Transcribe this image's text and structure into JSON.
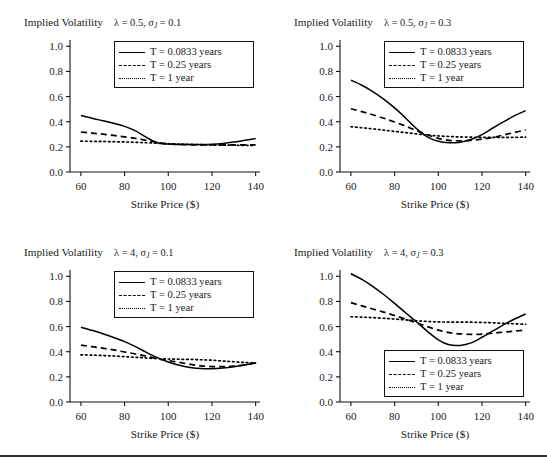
{
  "figure": {
    "ghost_caption_fragment": "",
    "bottom_rule": true
  },
  "axis": {
    "y_title": "Implied Volatility",
    "x_title": "Strike Price ($)",
    "y_ticks": [
      "0.0",
      "0.2",
      "0.4",
      "0.6",
      "0.8",
      "1.0"
    ],
    "y_tick_values": [
      0.0,
      0.2,
      0.4,
      0.6,
      0.8,
      1.0
    ],
    "x_ticks": [
      "60",
      "80",
      "100",
      "120",
      "140"
    ],
    "x_tick_values": [
      60,
      80,
      100,
      120,
      140
    ],
    "xlim": [
      55,
      142
    ],
    "ylim": [
      0.0,
      1.05
    ]
  },
  "legend": {
    "entries": [
      {
        "style": "solid",
        "label": "T = 0.0833 years"
      },
      {
        "style": "dashed",
        "label": "T = 0.25 years"
      },
      {
        "style": "dotted",
        "label": "T = 1 year"
      }
    ]
  },
  "panels": [
    {
      "id": "panel-lambda05-sigma01",
      "params_html": "&#955; = 0.5, &#963;<sub>J</sub> = 0.1",
      "params_text": "λ = 0.5, σ_J = 0.1",
      "lambda": 0.5,
      "sigma_j": 0.1,
      "legend_position": "top-right"
    },
    {
      "id": "panel-lambda05-sigma03",
      "params_html": "&#955; = 0.5, &#963;<sub>J</sub> = 0.3",
      "params_text": "λ = 0.5, σ_J = 0.3",
      "lambda": 0.5,
      "sigma_j": 0.3,
      "legend_position": "top-right"
    },
    {
      "id": "panel-lambda4-sigma01",
      "params_html": "&#955; = 4, &#963;<sub>J</sub> = 0.1",
      "params_text": "λ = 4, σ_J = 0.1",
      "lambda": 4,
      "sigma_j": 0.1,
      "legend_position": "top-right"
    },
    {
      "id": "panel-lambda4-sigma03",
      "params_html": "&#955; = 4, &#963;<sub>J</sub> = 0.3",
      "params_text": "λ = 4, σ_J = 0.3",
      "lambda": 4,
      "sigma_j": 0.3,
      "legend_position": "bottom-right"
    }
  ],
  "chart_data": [
    {
      "type": "line",
      "title": "λ = 0.5, σ_J = 0.1",
      "xlabel": "Strike Price ($)",
      "ylabel": "Implied Volatility",
      "xlim": [
        55,
        142
      ],
      "ylim": [
        0.0,
        1.05
      ],
      "grid": false,
      "legend_position": "upper right",
      "x": [
        60,
        65,
        70,
        75,
        80,
        85,
        90,
        95,
        100,
        105,
        110,
        115,
        120,
        125,
        130,
        135,
        140
      ],
      "series": [
        {
          "name": "T = 0.0833 years",
          "style": "solid",
          "values": [
            0.45,
            0.428,
            0.408,
            0.388,
            0.363,
            0.327,
            0.275,
            0.233,
            0.222,
            0.219,
            0.218,
            0.218,
            0.22,
            0.227,
            0.238,
            0.252,
            0.266
          ]
        },
        {
          "name": "T = 0.25 years",
          "style": "dashed",
          "values": [
            0.318,
            0.31,
            0.301,
            0.291,
            0.28,
            0.267,
            0.252,
            0.235,
            0.224,
            0.219,
            0.217,
            0.216,
            0.216,
            0.216,
            0.216,
            0.216,
            0.216
          ]
        },
        {
          "name": "T = 1 year",
          "style": "dotted",
          "values": [
            0.245,
            0.244,
            0.243,
            0.241,
            0.239,
            0.236,
            0.233,
            0.229,
            0.225,
            0.222,
            0.219,
            0.217,
            0.215,
            0.214,
            0.213,
            0.212,
            0.212
          ]
        }
      ]
    },
    {
      "type": "line",
      "title": "λ = 0.5, σ_J = 0.3",
      "xlabel": "Strike Price ($)",
      "ylabel": "Implied Volatility",
      "xlim": [
        55,
        142
      ],
      "ylim": [
        0.0,
        1.05
      ],
      "grid": false,
      "legend_position": "upper right",
      "x": [
        60,
        65,
        70,
        75,
        80,
        85,
        90,
        95,
        100,
        105,
        110,
        115,
        120,
        125,
        130,
        135,
        140
      ],
      "series": [
        {
          "name": "T = 0.0833 years",
          "style": "solid",
          "values": [
            0.73,
            0.69,
            0.64,
            0.58,
            0.51,
            0.43,
            0.345,
            0.28,
            0.244,
            0.233,
            0.237,
            0.258,
            0.298,
            0.35,
            0.4,
            0.448,
            0.488
          ]
        },
        {
          "name": "T = 0.25 years",
          "style": "dashed",
          "values": [
            0.503,
            0.48,
            0.455,
            0.428,
            0.398,
            0.365,
            0.33,
            0.296,
            0.268,
            0.252,
            0.248,
            0.252,
            0.262,
            0.275,
            0.295,
            0.315,
            0.335
          ]
        },
        {
          "name": "T = 1 year",
          "style": "dotted",
          "values": [
            0.36,
            0.352,
            0.343,
            0.333,
            0.323,
            0.313,
            0.303,
            0.294,
            0.287,
            0.282,
            0.279,
            0.277,
            0.276,
            0.275,
            0.275,
            0.276,
            0.277
          ]
        }
      ]
    },
    {
      "type": "line",
      "title": "λ = 4, σ_J = 0.1",
      "xlabel": "Strike Price ($)",
      "ylabel": "Implied Volatility",
      "xlim": [
        55,
        142
      ],
      "ylim": [
        0.0,
        1.05
      ],
      "grid": false,
      "legend_position": "upper right",
      "x": [
        60,
        65,
        70,
        75,
        80,
        85,
        90,
        95,
        100,
        105,
        110,
        115,
        120,
        125,
        130,
        135,
        140
      ],
      "series": [
        {
          "name": "T = 0.0833 years",
          "style": "solid",
          "values": [
            0.595,
            0.57,
            0.543,
            0.513,
            0.48,
            0.44,
            0.395,
            0.353,
            0.318,
            0.292,
            0.275,
            0.266,
            0.265,
            0.27,
            0.28,
            0.295,
            0.31
          ]
        },
        {
          "name": "T = 0.25 years",
          "style": "dashed",
          "values": [
            0.452,
            0.44,
            0.428,
            0.414,
            0.398,
            0.382,
            0.364,
            0.345,
            0.33,
            0.315,
            0.3,
            0.288,
            0.282,
            0.281,
            0.285,
            0.295,
            0.312
          ]
        },
        {
          "name": "T = 1 year",
          "style": "dotted",
          "values": [
            0.375,
            0.373,
            0.37,
            0.366,
            0.361,
            0.356,
            0.35,
            0.345,
            0.342,
            0.34,
            0.339,
            0.336,
            0.332,
            0.326,
            0.32,
            0.314,
            0.31
          ]
        }
      ]
    },
    {
      "type": "line",
      "title": "λ = 4, σ_J = 0.3",
      "xlabel": "Strike Price ($)",
      "ylabel": "Implied Volatility",
      "xlim": [
        55,
        142
      ],
      "ylim": [
        0.0,
        1.05
      ],
      "grid": false,
      "legend_position": "lower right",
      "x": [
        60,
        65,
        70,
        75,
        80,
        85,
        90,
        95,
        100,
        105,
        110,
        115,
        120,
        125,
        130,
        135,
        140
      ],
      "series": [
        {
          "name": "T = 0.0833 years",
          "style": "solid",
          "values": [
            1.02,
            0.975,
            0.92,
            0.855,
            0.785,
            0.71,
            0.638,
            0.562,
            0.495,
            0.455,
            0.45,
            0.47,
            0.515,
            0.565,
            0.615,
            0.66,
            0.7
          ]
        },
        {
          "name": "T = 0.25 years",
          "style": "dashed",
          "values": [
            0.79,
            0.765,
            0.74,
            0.715,
            0.688,
            0.66,
            0.63,
            0.6,
            0.572,
            0.552,
            0.542,
            0.538,
            0.54,
            0.548,
            0.556,
            0.564,
            0.572
          ]
        },
        {
          "name": "T = 1 year",
          "style": "dotted",
          "values": [
            0.678,
            0.675,
            0.671,
            0.666,
            0.66,
            0.653,
            0.646,
            0.641,
            0.637,
            0.636,
            0.636,
            0.635,
            0.633,
            0.63,
            0.626,
            0.622,
            0.618
          ]
        }
      ]
    }
  ]
}
